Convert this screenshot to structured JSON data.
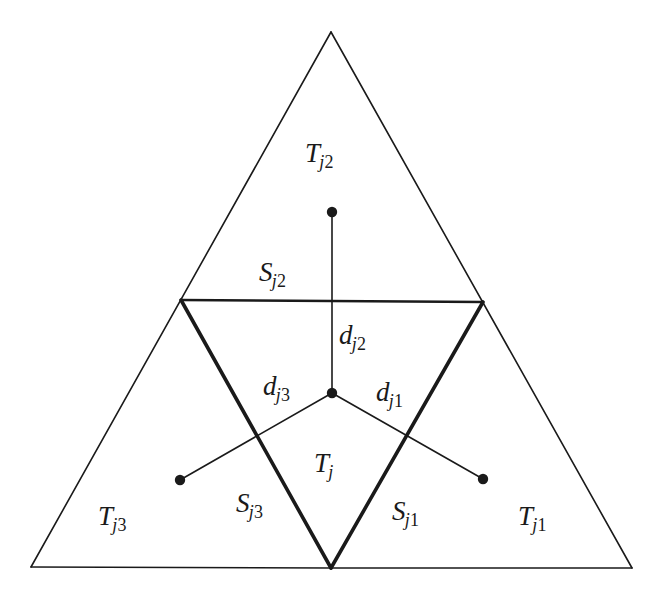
{
  "figure": {
    "kind": "geometric-diagram",
    "background_color": "#ffffff",
    "stroke_color": "#1a1a1a",
    "width": 661,
    "height": 601
  },
  "geometry": {
    "outer_triangle": {
      "apex": [
        331,
        32
      ],
      "bottom_left": [
        31,
        567
      ],
      "bottom_right": [
        632,
        568
      ],
      "stroke_width": 1.6
    },
    "inner_triangle": {
      "left": [
        181,
        300
      ],
      "right": [
        483,
        302
      ],
      "bottom": [
        331,
        568
      ],
      "stroke_width": 3.6
    },
    "top_edge_segment": {
      "from": [
        181,
        300
      ],
      "to": [
        483,
        302
      ],
      "stroke_width": 2.6
    },
    "nodes": {
      "center": [
        332,
        393
      ],
      "top": [
        332,
        212
      ],
      "left": [
        180,
        480
      ],
      "right": [
        483,
        479
      ],
      "radius": 5.2
    },
    "connectors": [
      {
        "name": "d_j2",
        "from": [
          332,
          393
        ],
        "to": [
          332,
          212
        ],
        "stroke_width": 1.6
      },
      {
        "name": "d_j3",
        "from": [
          332,
          393
        ],
        "to": [
          180,
          480
        ],
        "stroke_width": 1.6
      },
      {
        "name": "d_j1",
        "from": [
          332,
          393
        ],
        "to": [
          483,
          479
        ],
        "stroke_width": 1.6
      }
    ]
  },
  "labels": {
    "region_center": {
      "base": "T",
      "sub_letter": "j",
      "sub_digit": "",
      "x": 314,
      "y": 450
    },
    "region_top": {
      "base": "T",
      "sub_letter": "j",
      "sub_digit": "2",
      "x": 305,
      "y": 140
    },
    "region_bottom_left": {
      "base": "T",
      "sub_letter": "j",
      "sub_digit": "3",
      "x": 98,
      "y": 503
    },
    "region_bottom_right": {
      "base": "T",
      "sub_letter": "j",
      "sub_digit": "1",
      "x": 518,
      "y": 503
    },
    "edge_top": {
      "base": "S",
      "sub_letter": "j",
      "sub_digit": "2",
      "x": 259,
      "y": 259
    },
    "edge_left": {
      "base": "S",
      "sub_letter": "j",
      "sub_digit": "3",
      "x": 236,
      "y": 490
    },
    "edge_right": {
      "base": "S",
      "sub_letter": "j",
      "sub_digit": "1",
      "x": 392,
      "y": 498
    },
    "dist_top": {
      "base": "d",
      "sub_letter": "j",
      "sub_digit": "2",
      "x": 339,
      "y": 322
    },
    "dist_left": {
      "base": "d",
      "sub_letter": "j",
      "sub_digit": "3",
      "x": 263,
      "y": 373
    },
    "dist_right": {
      "base": "d",
      "sub_letter": "j",
      "sub_digit": "1",
      "x": 376,
      "y": 379
    }
  }
}
